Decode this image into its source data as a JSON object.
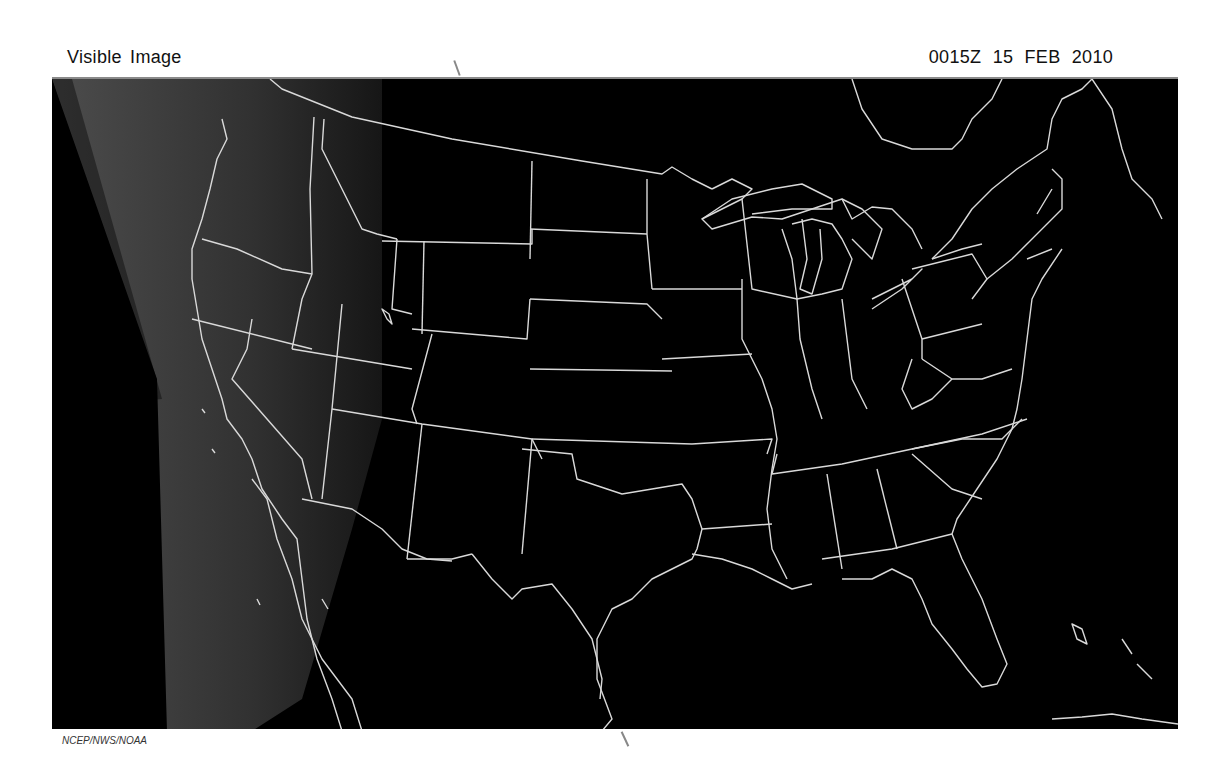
{
  "header": {
    "product_title": "Visible Image",
    "valid_time": "0015Z",
    "valid_date": "15 FEB 2010"
  },
  "map": {
    "type": "satellite-visible",
    "region": "Contiguous United States",
    "background_color": "#000000",
    "boundary_color": "#d9d9d9",
    "cloud_color": "#4a4a4a"
  },
  "footer": {
    "credit": "NCEP/NWS/NOAA"
  }
}
